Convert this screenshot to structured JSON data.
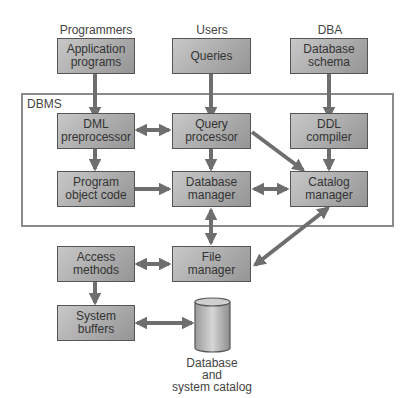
{
  "actors": {
    "programmers": "Programmers",
    "users": "Users",
    "dba": "DBA"
  },
  "frame_label": "DBMS",
  "boxes": {
    "app_programs": "Application\nprograms",
    "queries": "Queries",
    "db_schema": "Database\nschema",
    "dml": "DML\npreprocessor",
    "query_proc": "Query\nprocessor",
    "ddl": "DDL\ncompiler",
    "prog_obj": "Program\nobject code",
    "db_manager": "Database\nmanager",
    "catalog": "Catalog\nmanager",
    "access": "Access\nmethods",
    "file_mgr": "File\nmanager",
    "sys_buffers": "System\nbuffers"
  },
  "storage_label": "Database\nand\nsystem catalog",
  "colors": {
    "arrow": "#6e6e6e",
    "frame": "#8a8a8a",
    "box_border": "#555555"
  }
}
